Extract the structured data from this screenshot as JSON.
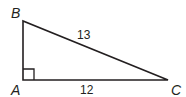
{
  "diagram": {
    "type": "right-triangle",
    "stroke_color": "#231f20",
    "vertices": {
      "A": {
        "label": "A",
        "x": 23,
        "y": 80
      },
      "B": {
        "label": "B",
        "x": 23,
        "y": 21
      },
      "C": {
        "label": "C",
        "x": 168,
        "y": 80
      }
    },
    "sides": {
      "BC": {
        "label": "13"
      },
      "AC": {
        "label": "12"
      }
    },
    "right_angle_at": "A"
  }
}
